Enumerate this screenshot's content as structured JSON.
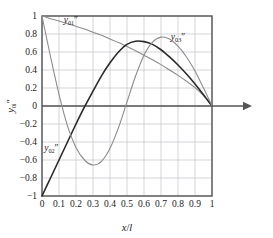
{
  "chart_data": {
    "type": "line",
    "title": "",
    "xlabel": "x/l",
    "ylabel": "y₀ᵢ″",
    "xlim": [
      0,
      1
    ],
    "ylim": [
      -1,
      1
    ],
    "grid": true,
    "legend_position": "inline-annotations",
    "xticks": [
      "0",
      "0.1",
      "0.2",
      "0.3",
      "0.4",
      "0.5",
      "0.6",
      "0.7",
      "0.8",
      "0.9",
      "1"
    ],
    "xtick_values": [
      0,
      0.1,
      0.2,
      0.3,
      0.4,
      0.5,
      0.6,
      0.7,
      0.8,
      0.9,
      1
    ],
    "yticks": [
      "1",
      "0.8",
      "0.6",
      "0.4",
      "0.2",
      "0",
      "-0.2",
      "-0.4",
      "-0.6",
      "-0.8",
      "-1"
    ],
    "ytick_values": [
      1,
      0.8,
      0.6,
      0.4,
      0.2,
      0,
      -0.2,
      -0.4,
      -0.6,
      -0.8,
      -1
    ],
    "x": [
      0,
      0.05,
      0.1,
      0.15,
      0.2,
      0.25,
      0.3,
      0.35,
      0.4,
      0.45,
      0.5,
      0.55,
      0.6,
      0.65,
      0.7,
      0.75,
      0.8,
      0.85,
      0.9,
      0.95,
      1
    ],
    "series": [
      {
        "name": "y01",
        "label": "y₀₁″",
        "color": "#8c8c8c",
        "width": 1.1,
        "label_x": 0.17,
        "label_y": 0.92,
        "values": [
          1.0,
          0.97,
          0.945,
          0.915,
          0.885,
          0.855,
          0.82,
          0.785,
          0.745,
          0.705,
          0.66,
          0.615,
          0.565,
          0.515,
          0.46,
          0.4,
          0.34,
          0.275,
          0.205,
          0.115,
          0.0
        ]
      },
      {
        "name": "y02",
        "label": "y₀₂″",
        "color": "#2a2a2a",
        "width": 1.6,
        "label_x": 0.055,
        "label_y": -0.5,
        "values": [
          -1.0,
          -0.8,
          -0.6,
          -0.4,
          -0.2,
          -0.01,
          0.165,
          0.335,
          0.48,
          0.6,
          0.685,
          0.72,
          0.715,
          0.685,
          0.625,
          0.545,
          0.455,
          0.355,
          0.245,
          0.125,
          0.0
        ]
      },
      {
        "name": "y03",
        "label": "y₀₃″",
        "color": "#8c8c8c",
        "width": 1.1,
        "label_x": 0.8,
        "label_y": 0.73,
        "values": [
          1.0,
          0.55,
          0.13,
          -0.22,
          -0.46,
          -0.6,
          -0.655,
          -0.615,
          -0.47,
          -0.24,
          0.045,
          0.33,
          0.565,
          0.71,
          0.765,
          0.745,
          0.665,
          0.545,
          0.39,
          0.2,
          0.0
        ]
      }
    ],
    "annotations": [
      {
        "name": "x-axis-arrow",
        "type": "arrow",
        "from_x": 1.0,
        "to_x": 1.22,
        "y": 0
      }
    ],
    "colors": {
      "frame": "#555555",
      "grid": "#b9b9c4",
      "zero_line": "#555555",
      "text": "#1a1a1a",
      "background": "#ffffff"
    }
  }
}
